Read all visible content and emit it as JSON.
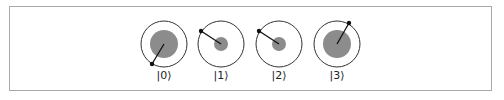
{
  "diagram": {
    "type": "circle-notation",
    "colors": {
      "frame": "#a8a8a8",
      "outer_circle": "#333333",
      "magnitude_fill": "#8c8c8c",
      "phase_line": "#111111"
    },
    "states": [
      {
        "label": "|0⟩",
        "cx": 164,
        "cy": 44,
        "outer_r": 23,
        "magnitude_r": 14,
        "phase_dot": {
          "x": 152,
          "y": 64
        }
      },
      {
        "label": "|1⟩",
        "cx": 221,
        "cy": 44,
        "outer_r": 23,
        "magnitude_r": 7,
        "phase_dot": {
          "x": 201,
          "y": 31
        }
      },
      {
        "label": "|2⟩",
        "cx": 279,
        "cy": 44,
        "outer_r": 23,
        "magnitude_r": 7,
        "phase_dot": {
          "x": 259,
          "y": 31
        }
      },
      {
        "label": "|3⟩",
        "cx": 337,
        "cy": 44,
        "outer_r": 23,
        "magnitude_r": 14,
        "phase_dot": {
          "x": 349,
          "y": 23
        }
      }
    ]
  }
}
